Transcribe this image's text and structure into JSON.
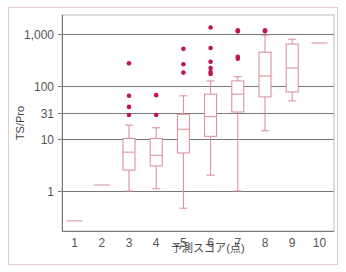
{
  "chart_data": {
    "type": "box",
    "title": "",
    "xlabel": "予測スコア(点)",
    "ylabel": "TS/Pro",
    "yscale": "log",
    "ylim": [
      0.17,
      2000
    ],
    "yticks": [
      1,
      10,
      31,
      100,
      1000
    ],
    "ytick_labels": [
      "1",
      "10",
      "31",
      "100",
      "1,000"
    ],
    "grid": true,
    "categories": [
      "1",
      "2",
      "3",
      "4",
      "5",
      "6",
      "7",
      "8",
      "9",
      "10"
    ],
    "boxes": [
      {
        "category": "1",
        "single": 0.27
      },
      {
        "category": "2",
        "single": 1.3
      },
      {
        "category": "3",
        "whisker_low": 1,
        "q1": 2.5,
        "median": 5.5,
        "q3": 10,
        "whisker_high": 18,
        "outliers": [
          28,
          40,
          65,
          270
        ]
      },
      {
        "category": "4",
        "whisker_low": 1.1,
        "q1": 3,
        "median": 4.8,
        "q3": 10,
        "whisker_high": 16,
        "outliers": [
          28,
          67
        ]
      },
      {
        "category": "5",
        "whisker_low": 0.47,
        "q1": 5.3,
        "median": 15,
        "q3": 29,
        "whisker_high": 65,
        "outliers": [
          180,
          260,
          510
        ]
      },
      {
        "category": "6",
        "whisker_low": 2,
        "q1": 11,
        "median": 26,
        "q3": 70,
        "whisker_high": 125,
        "outliers": [
          170,
          185,
          220,
          290,
          530,
          1300
        ]
      },
      {
        "category": "7",
        "whisker_low": 1,
        "q1": 32,
        "median": 70,
        "q3": 125,
        "whisker_high": 150,
        "outliers": [
          330,
          360,
          1100,
          1150
        ]
      },
      {
        "category": "8",
        "whisker_low": 14,
        "q1": 62,
        "median": 155,
        "q3": 440,
        "whisker_high": 930,
        "outliers": [
          1100,
          1150
        ]
      },
      {
        "category": "9",
        "whisker_low": 52,
        "q1": 77,
        "median": 220,
        "q3": 630,
        "whisker_high": 780,
        "outliers": []
      },
      {
        "category": "10",
        "single": 660
      }
    ],
    "colors": {
      "box": "#d98a98",
      "outlier": "#c0174a",
      "grid": "#555555",
      "frame": "#e8c9cf"
    }
  }
}
